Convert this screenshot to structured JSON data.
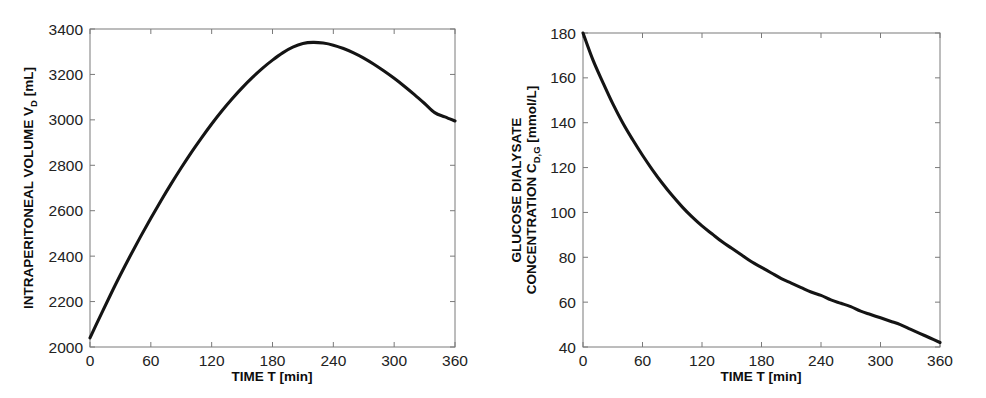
{
  "figure": {
    "background": "#ffffff",
    "line_color": "#141414",
    "axis_color": "#7a7a7a"
  },
  "panels": [
    {
      "id": "intraperitoneal-volume",
      "xlabel_main": "TIME T [min]",
      "ylabel_main": "INTRAPERITONEAL VOLUME V",
      "ylabel_sub": "D",
      "ylabel_unit": " [mL]",
      "xticks": [
        "0",
        "60",
        "120",
        "180",
        "240",
        "300",
        "360"
      ],
      "yticks": [
        "2000",
        "2200",
        "2400",
        "2600",
        "2800",
        "3000",
        "3200",
        "3400"
      ]
    },
    {
      "id": "glucose-dialysate-concentration",
      "xlabel_main": "TIME T [min]",
      "ylabel_line1": "GLUCOSE DIALYSATE",
      "ylabel_line2_main": "CONCENTRATION C",
      "ylabel_line2_sub": "D,G",
      "ylabel_line2_unit": " [mmol/L]",
      "xticks": [
        "0",
        "60",
        "120",
        "180",
        "240",
        "300",
        "360"
      ],
      "yticks": [
        "40",
        "60",
        "80",
        "100",
        "120",
        "140",
        "160",
        "180"
      ]
    }
  ],
  "chart_data": [
    {
      "type": "line",
      "title": "",
      "xlabel": "TIME T [min]",
      "ylabel": "INTRAPERITONEAL VOLUME V_D [mL]",
      "xlim": [
        0,
        360
      ],
      "ylim": [
        2000,
        3400
      ],
      "xticks": [
        0,
        60,
        120,
        180,
        240,
        300,
        360
      ],
      "yticks": [
        2000,
        2200,
        2400,
        2600,
        2800,
        3000,
        3200,
        3400
      ],
      "grid": false,
      "legend": "none",
      "series": [
        {
          "name": "Intraperitoneal volume",
          "x": [
            0,
            10,
            20,
            30,
            40,
            50,
            60,
            70,
            80,
            90,
            100,
            110,
            120,
            130,
            140,
            150,
            160,
            170,
            180,
            190,
            200,
            210,
            220,
            230,
            240,
            250,
            260,
            270,
            280,
            290,
            300,
            310,
            320,
            330,
            340,
            350,
            360
          ],
          "y": [
            2040,
            2135,
            2228,
            2318,
            2404,
            2487,
            2567,
            2644,
            2718,
            2789,
            2857,
            2921,
            2982,
            3039,
            3092,
            3141,
            3186,
            3227,
            3263,
            3295,
            3320,
            3336,
            3341,
            3338,
            3329,
            3314,
            3295,
            3272,
            3245,
            3215,
            3183,
            3148,
            3111,
            3072,
            3032,
            3013,
            2995
          ]
        }
      ]
    },
    {
      "type": "line",
      "title": "",
      "xlabel": "TIME T [min]",
      "ylabel": "GLUCOSE DIALYSATE CONCENTRATION C_D,G [mmol/L]",
      "xlim": [
        0,
        360
      ],
      "ylim": [
        40,
        180
      ],
      "xticks": [
        0,
        60,
        120,
        180,
        240,
        300,
        360
      ],
      "yticks": [
        40,
        60,
        80,
        100,
        120,
        140,
        160,
        180
      ],
      "grid": false,
      "legend": "none",
      "series": [
        {
          "name": "Glucose dialysate concentration",
          "x": [
            0,
            10,
            20,
            30,
            40,
            50,
            60,
            70,
            80,
            90,
            100,
            110,
            120,
            130,
            140,
            150,
            160,
            170,
            180,
            190,
            200,
            210,
            220,
            230,
            240,
            250,
            260,
            270,
            280,
            290,
            300,
            310,
            320,
            330,
            340,
            350,
            360
          ],
          "y": [
            180.0,
            168.0,
            158.0,
            148.5,
            140.0,
            132.5,
            125.5,
            119.0,
            113.0,
            107.5,
            102.5,
            98.0,
            94.0,
            90.5,
            87.0,
            84.0,
            81.0,
            78.0,
            75.5,
            73.0,
            70.5,
            68.5,
            66.5,
            64.5,
            63.0,
            61.0,
            59.5,
            58.0,
            56.0,
            54.5,
            53.0,
            51.5,
            50.0,
            48.0,
            46.0,
            44.0,
            42.0
          ]
        }
      ]
    }
  ]
}
